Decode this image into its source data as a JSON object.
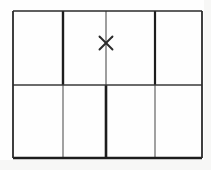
{
  "figure": {
    "background_color": "#fefefe",
    "margin_tone_color": "#f7f7f6",
    "stroke_color_dark": "#1d1d1d",
    "stroke_color_medium": "#4a4a4a",
    "stroke_color_light": "#808080",
    "rows": 2,
    "columns": 4
  },
  "geometry": {
    "left": 13,
    "right": 202,
    "top": 11,
    "bottom": 158,
    "middle_y": 85,
    "vertical_x": [
      63,
      106,
      155
    ],
    "width": 189,
    "height": 147
  },
  "border": {
    "top": {
      "name": "top-border",
      "x1": 13,
      "y1": 11,
      "x2": 202,
      "y2": 11,
      "width": 1.6,
      "color": "#2a2a2a"
    },
    "bottom": {
      "name": "bottom-border",
      "x1": 13,
      "y1": 158,
      "x2": 202,
      "y2": 158,
      "width": 2.4,
      "color": "#1d1d1d"
    },
    "left": {
      "name": "left-border",
      "x1": 13,
      "y1": 11,
      "x2": 13,
      "y2": 158,
      "width": 1.8,
      "color": "#2a2a2a"
    },
    "right": {
      "name": "right-border",
      "x1": 202,
      "y1": 11,
      "x2": 202,
      "y2": 158,
      "width": 1.8,
      "color": "#2a2a2a"
    }
  },
  "dividers": {
    "horizontal": {
      "name": "horizontal-divider",
      "x1": 13,
      "y1": 85,
      "x2": 202,
      "y2": 85,
      "width": 1.7,
      "color": "#3a3a3a"
    },
    "vertical_top": [
      {
        "name": "vertical-divider-1-top",
        "x": 63,
        "y1": 11,
        "y2": 85,
        "width": 2.4,
        "color": "#1d1d1d"
      },
      {
        "name": "vertical-divider-2-top",
        "x": 106,
        "y1": 11,
        "y2": 85,
        "width": 1.3,
        "color": "#6a6a6a"
      },
      {
        "name": "vertical-divider-3-top",
        "x": 155,
        "y1": 11,
        "y2": 85,
        "width": 2.2,
        "color": "#1d1d1d"
      }
    ],
    "vertical_bottom": [
      {
        "name": "vertical-divider-1-bottom",
        "x": 63,
        "y1": 85,
        "y2": 158,
        "width": 1.3,
        "color": "#6f6f6f"
      },
      {
        "name": "vertical-divider-2-bottom",
        "x": 106,
        "y1": 85,
        "y2": 158,
        "width": 2.6,
        "color": "#1d1d1d"
      },
      {
        "name": "vertical-divider-3-bottom",
        "x": 155,
        "y1": 85,
        "y2": 158,
        "width": 1.3,
        "color": "#6f6f6f"
      }
    ]
  },
  "mark": {
    "label": "x",
    "type": "cross",
    "cx": 106,
    "cy": 43,
    "size": 13,
    "stroke_width": 1.9,
    "color": "#2b2b2b",
    "cell_row": 1,
    "cell_column": 2
  },
  "cells": [
    {
      "name": "cell-r1c1",
      "x": 13,
      "y": 11,
      "w": 50,
      "h": 74,
      "row": 1,
      "col": 1,
      "contents": ""
    },
    {
      "name": "cell-r1c2",
      "x": 63,
      "y": 11,
      "w": 43,
      "h": 74,
      "row": 1,
      "col": 2,
      "contents": ""
    },
    {
      "name": "cell-r1c3",
      "x": 106,
      "y": 11,
      "w": 49,
      "h": 74,
      "row": 1,
      "col": 3,
      "contents": ""
    },
    {
      "name": "cell-r1c4",
      "x": 155,
      "y": 11,
      "w": 47,
      "h": 74,
      "row": 1,
      "col": 4,
      "contents": ""
    },
    {
      "name": "cell-r2c1",
      "x": 13,
      "y": 85,
      "w": 50,
      "h": 73,
      "row": 2,
      "col": 1,
      "contents": ""
    },
    {
      "name": "cell-r2c2",
      "x": 63,
      "y": 85,
      "w": 43,
      "h": 73,
      "row": 2,
      "col": 2,
      "contents": ""
    },
    {
      "name": "cell-r2c3",
      "x": 106,
      "y": 85,
      "w": 49,
      "h": 73,
      "row": 2,
      "col": 3,
      "contents": ""
    },
    {
      "name": "cell-r2c4",
      "x": 155,
      "y": 85,
      "w": 47,
      "h": 73,
      "row": 2,
      "col": 4,
      "contents": ""
    }
  ]
}
